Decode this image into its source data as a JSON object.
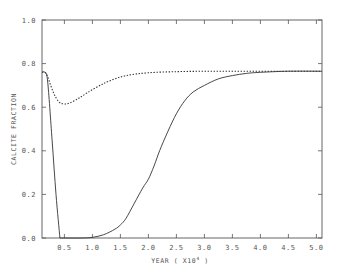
{
  "chart_data": {
    "type": "line",
    "title": "",
    "xlabel": "YEAR ( X10",
    "xlabel_exponent": "4",
    "xlabel_suffix": " )",
    "ylabel": "CALCITE FRACTION",
    "xlim": [
      0.1,
      5.1
    ],
    "ylim": [
      0.0,
      1.0
    ],
    "x_ticks": [
      0.5,
      1.0,
      1.5,
      2.0,
      2.5,
      3.0,
      3.5,
      4.0,
      4.5,
      5.0
    ],
    "x_tick_labels": [
      "0.5",
      "1.0",
      "1.5",
      "2.0",
      "2.5",
      "3.0",
      "3.5",
      "4.0",
      "4.5",
      "5.0"
    ],
    "y_ticks": [
      0.0,
      0.2,
      0.4,
      0.6,
      0.8,
      1.0
    ],
    "y_tick_labels": [
      "0.0",
      "0.2",
      "0.4",
      "0.6",
      "0.8",
      "1.0"
    ],
    "grid": false,
    "legend": null,
    "series": [
      {
        "name": "solid-drop",
        "style": "solid",
        "x": [
          0.1,
          0.15,
          0.2,
          0.28,
          0.35,
          0.42
        ],
        "y": [
          0.76,
          0.76,
          0.72,
          0.45,
          0.2,
          0.0
        ]
      },
      {
        "name": "solid-recovery",
        "style": "solid",
        "x": [
          0.42,
          0.8,
          1.0,
          1.2,
          1.4,
          1.5,
          1.6,
          1.75,
          1.9,
          2.0,
          2.1,
          2.2,
          2.35,
          2.5,
          2.65,
          2.8,
          3.0,
          3.25,
          3.5,
          3.75,
          4.0,
          4.5,
          5.1
        ],
        "y": [
          0.0,
          0.0,
          0.003,
          0.015,
          0.04,
          0.06,
          0.09,
          0.16,
          0.23,
          0.27,
          0.33,
          0.4,
          0.49,
          0.57,
          0.63,
          0.67,
          0.7,
          0.73,
          0.745,
          0.755,
          0.76,
          0.765,
          0.765
        ]
      },
      {
        "name": "dashed",
        "style": "dashed",
        "x": [
          0.1,
          0.15,
          0.2,
          0.3,
          0.4,
          0.5,
          0.6,
          0.75,
          0.9,
          1.1,
          1.3,
          1.6,
          2.0,
          2.5,
          3.0,
          3.5,
          4.0,
          4.5,
          5.1
        ],
        "y": [
          0.76,
          0.76,
          0.74,
          0.67,
          0.625,
          0.615,
          0.62,
          0.64,
          0.665,
          0.695,
          0.72,
          0.745,
          0.758,
          0.763,
          0.765,
          0.765,
          0.765,
          0.765,
          0.765
        ]
      }
    ]
  },
  "colors": {
    "line": "#333333",
    "axis": "#555555",
    "text": "#555555",
    "background": "#ffffff"
  }
}
